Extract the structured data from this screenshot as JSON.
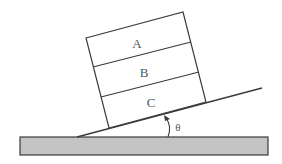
{
  "diagram": {
    "blocks": [
      {
        "id": "block-a",
        "label": "A"
      },
      {
        "id": "block-b",
        "label": "B"
      },
      {
        "id": "block-c",
        "label": "C"
      }
    ],
    "angle_label": "θ",
    "colors": {
      "stroke": "#3a3a3a",
      "ground_fill": "#c4c4c4",
      "label": "#555555"
    }
  }
}
